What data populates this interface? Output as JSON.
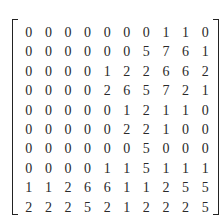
{
  "matrix": {
    "rows": [
      [
        0,
        0,
        0,
        0,
        0,
        0,
        0,
        1,
        1,
        0
      ],
      [
        0,
        0,
        0,
        0,
        0,
        0,
        5,
        7,
        6,
        1
      ],
      [
        0,
        0,
        0,
        0,
        1,
        2,
        2,
        6,
        6,
        2
      ],
      [
        0,
        0,
        0,
        0,
        2,
        6,
        5,
        7,
        2,
        1
      ],
      [
        0,
        0,
        0,
        0,
        0,
        1,
        2,
        1,
        1,
        0
      ],
      [
        0,
        0,
        0,
        0,
        0,
        2,
        2,
        1,
        0,
        0
      ],
      [
        0,
        0,
        0,
        0,
        0,
        0,
        5,
        0,
        0,
        0
      ],
      [
        0,
        0,
        0,
        0,
        1,
        1,
        5,
        1,
        1,
        1
      ],
      [
        1,
        1,
        2,
        6,
        6,
        1,
        1,
        2,
        5,
        5
      ],
      [
        2,
        2,
        2,
        5,
        2,
        1,
        2,
        2,
        2,
        5
      ]
    ]
  }
}
